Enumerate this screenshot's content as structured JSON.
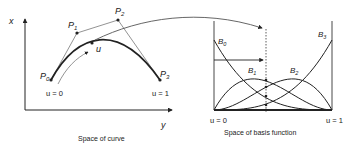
{
  "curve_space": {
    "caption": "Space of curve",
    "axis_x_label": "x",
    "axis_y_label": "y",
    "control_points": [
      {
        "name": "P",
        "sub": "0",
        "x": 51,
        "y": 80
      },
      {
        "name": "P",
        "sub": "1",
        "x": 77,
        "y": 33
      },
      {
        "name": "P",
        "sub": "2",
        "x": 118,
        "y": 20
      },
      {
        "name": "P",
        "sub": "3",
        "x": 160,
        "y": 80
      }
    ],
    "param_label": "u",
    "start_label": "u = 0",
    "end_label": "u = 1"
  },
  "basis_space": {
    "caption": "Space of basis function",
    "start_label": "u = 0",
    "end_label": "u = 1",
    "functions": [
      {
        "name": "B",
        "sub": "0"
      },
      {
        "name": "B",
        "sub": "1"
      },
      {
        "name": "B",
        "sub": "2"
      },
      {
        "name": "B",
        "sub": "3"
      }
    ]
  },
  "colors": {
    "ink": "#222222",
    "control_polygon": "#777777",
    "background": "#ffffff"
  }
}
